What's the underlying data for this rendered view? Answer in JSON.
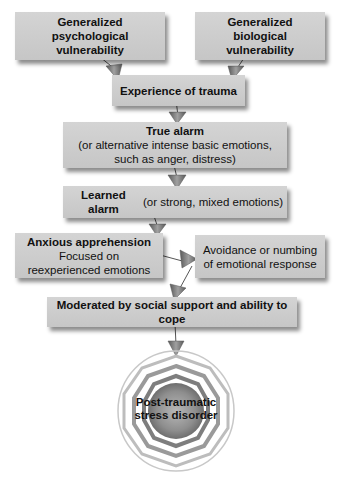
{
  "diagram": {
    "nodes": {
      "psych_vuln": {
        "line1": "Generalized",
        "line2": "psychological vulnerability"
      },
      "bio_vuln": {
        "line1": "Generalized",
        "line2": "biological vulnerability"
      },
      "trauma": {
        "label": "Experience of trauma"
      },
      "true_alarm": {
        "title": "True alarm",
        "line1": "(or alternative intense basic emotions,",
        "line2": "such as anger, distress)"
      },
      "learned_alarm": {
        "title": "Learned alarm",
        "detail": " (or strong, mixed emotions)"
      },
      "anxious": {
        "title": "Anxious apprehension",
        "line1": "Focused on",
        "line2": "reexperienced emotions"
      },
      "avoidance": {
        "line1": "Avoidance or numbing",
        "line2": "of emotional response"
      },
      "moderated": {
        "label": "Moderated by social support and ability to cope"
      },
      "ptsd": {
        "line1": "Post-traumatic",
        "line2": "stress disorder"
      }
    },
    "edges": [
      [
        "psych_vuln",
        "trauma"
      ],
      [
        "bio_vuln",
        "trauma"
      ],
      [
        "trauma",
        "true_alarm"
      ],
      [
        "true_alarm",
        "learned_alarm"
      ],
      [
        "learned_alarm",
        "anxious"
      ],
      [
        "anxious",
        "avoidance"
      ],
      [
        "avoidance",
        "moderated"
      ],
      [
        "moderated",
        "ptsd"
      ]
    ],
    "colors": {
      "box": "#cdcdcd",
      "arrow": "#7a7a7a",
      "text": "#111111"
    }
  }
}
